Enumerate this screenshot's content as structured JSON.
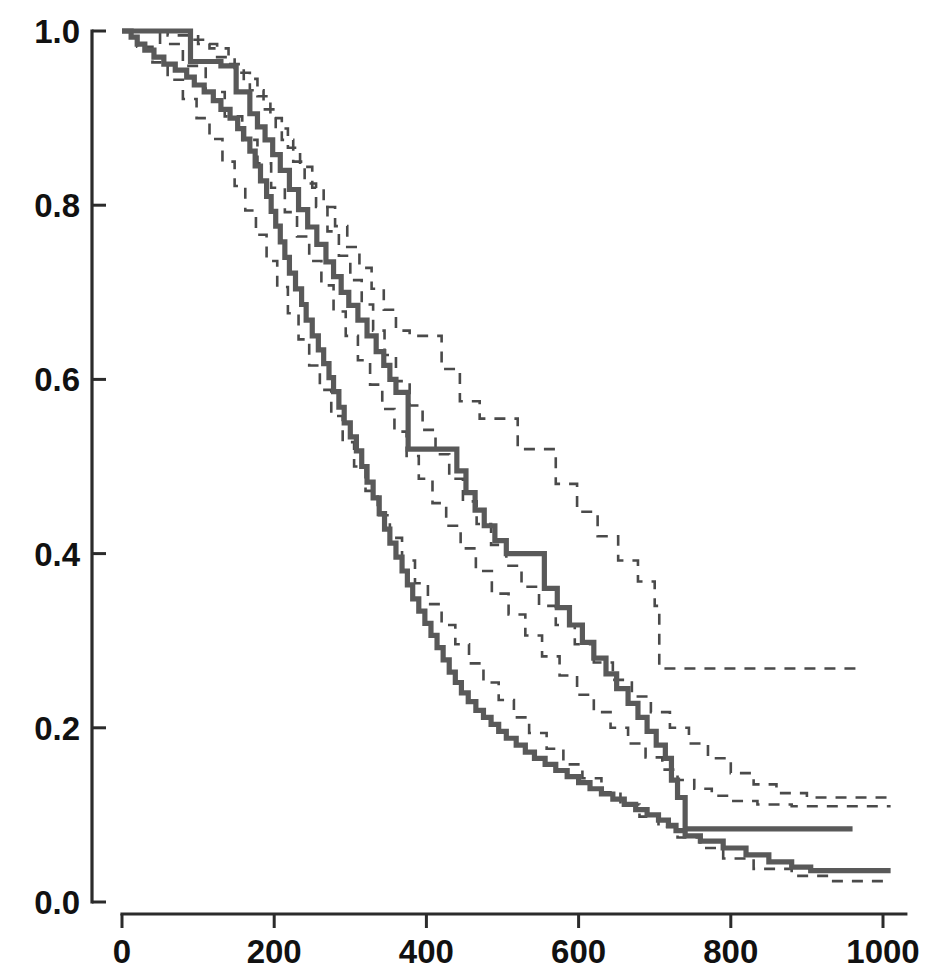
{
  "chart_data": {
    "type": "line",
    "subtype": "kaplan-meier-survival-step",
    "title": "",
    "subtitle": "",
    "xlabel": "",
    "ylabel": "",
    "xlim": [
      0,
      1030
    ],
    "ylim": [
      0.0,
      1.0
    ],
    "grid": false,
    "legend": "none",
    "x_ticks": [
      0,
      200,
      400,
      600,
      800,
      1000
    ],
    "x_tick_labels": [
      "0",
      "200",
      "400",
      "600",
      "800",
      "1000"
    ],
    "y_ticks": [
      0.0,
      0.2,
      0.4,
      0.6,
      0.8,
      1.0
    ],
    "y_tick_labels": [
      "0.0",
      "0.2",
      "0.4",
      "0.6",
      "0.8",
      "1.0"
    ],
    "colors": {
      "solid_curve": "#595959",
      "dashed_ci": "#4a4a4a",
      "axis": "#2b2b2b",
      "tick_text": "#111111",
      "background": "#ffffff"
    },
    "line_styles": {
      "estimate": "solid",
      "confidence_interval": "dashed"
    },
    "series": [
      {
        "name": "Group 1 estimate",
        "style": "solid",
        "x": [
          0,
          12,
          20,
          30,
          42,
          55,
          70,
          85,
          95,
          108,
          120,
          130,
          142,
          152,
          160,
          168,
          175,
          182,
          190,
          196,
          202,
          208,
          214,
          220,
          228,
          236,
          242,
          250,
          258,
          265,
          272,
          278,
          285,
          292,
          300,
          308,
          315,
          322,
          330,
          338,
          345,
          352,
          360,
          368,
          375,
          382,
          390,
          398,
          406,
          414,
          422,
          430,
          438,
          446,
          455,
          465,
          475,
          485,
          495,
          505,
          518,
          530,
          542,
          556,
          570,
          585,
          600,
          615,
          630,
          645,
          660,
          675,
          690,
          705,
          718,
          728,
          740,
          760,
          790,
          820,
          850,
          880,
          905,
          1010
        ],
        "y": [
          1.0,
          0.993,
          0.985,
          0.978,
          0.97,
          0.962,
          0.955,
          0.947,
          0.938,
          0.93,
          0.92,
          0.91,
          0.9,
          0.888,
          0.876,
          0.862,
          0.845,
          0.828,
          0.81,
          0.793,
          0.776,
          0.758,
          0.74,
          0.722,
          0.704,
          0.686,
          0.668,
          0.65,
          0.634,
          0.618,
          0.602,
          0.586,
          0.568,
          0.55,
          0.534,
          0.518,
          0.5,
          0.482,
          0.464,
          0.446,
          0.428,
          0.412,
          0.396,
          0.38,
          0.364,
          0.348,
          0.334,
          0.32,
          0.306,
          0.292,
          0.278,
          0.264,
          0.252,
          0.24,
          0.23,
          0.22,
          0.212,
          0.204,
          0.196,
          0.188,
          0.18,
          0.172,
          0.165,
          0.158,
          0.151,
          0.144,
          0.137,
          0.13,
          0.124,
          0.118,
          0.112,
          0.106,
          0.1,
          0.094,
          0.088,
          0.082,
          0.076,
          0.07,
          0.062,
          0.054,
          0.046,
          0.04,
          0.036,
          0.036
        ]
      },
      {
        "name": "Group 2 estimate",
        "style": "solid",
        "x": [
          0,
          60,
          90,
          130,
          150,
          168,
          178,
          188,
          198,
          208,
          220,
          232,
          244,
          256,
          268,
          278,
          288,
          298,
          310,
          322,
          334,
          344,
          352,
          360,
          376,
          431,
          440,
          452,
          464,
          476,
          490,
          505,
          520,
          555,
          572,
          588,
          605,
          620,
          636,
          650,
          665,
          678,
          690,
          702,
          714,
          722,
          730,
          740,
          960
        ],
        "y": [
          1.0,
          1.0,
          0.965,
          0.96,
          0.93,
          0.905,
          0.89,
          0.875,
          0.858,
          0.84,
          0.818,
          0.795,
          0.775,
          0.755,
          0.735,
          0.718,
          0.7,
          0.685,
          0.668,
          0.65,
          0.632,
          0.616,
          0.6,
          0.585,
          0.52,
          0.52,
          0.495,
          0.47,
          0.45,
          0.432,
          0.415,
          0.4,
          0.4,
          0.36,
          0.338,
          0.318,
          0.298,
          0.28,
          0.262,
          0.245,
          0.228,
          0.212,
          0.196,
          0.18,
          0.165,
          0.14,
          0.12,
          0.084,
          0.084
        ]
      },
      {
        "name": "Group 1 upper 95% CI",
        "style": "dashed",
        "x": [
          0,
          30,
          60,
          90,
          115,
          140,
          160,
          178,
          195,
          210,
          225,
          240,
          255,
          270,
          285,
          300,
          315,
          330,
          345,
          360,
          378,
          395,
          412,
          430,
          448,
          466,
          485,
          505,
          525,
          548,
          570,
          595,
          620,
          645,
          670,
          695,
          720,
          745,
          770,
          800,
          830,
          860,
          900,
          1010
        ],
        "y": [
          1.0,
          1.0,
          0.995,
          0.99,
          0.98,
          0.962,
          0.945,
          0.925,
          0.9,
          0.875,
          0.85,
          0.825,
          0.798,
          0.77,
          0.742,
          0.714,
          0.686,
          0.656,
          0.628,
          0.598,
          0.57,
          0.542,
          0.514,
          0.486,
          0.46,
          0.434,
          0.41,
          0.386,
          0.362,
          0.34,
          0.318,
          0.296,
          0.275,
          0.255,
          0.236,
          0.218,
          0.2,
          0.182,
          0.165,
          0.148,
          0.135,
          0.125,
          0.12,
          0.12
        ]
      },
      {
        "name": "Group 1 lower 95% CI",
        "style": "dashed",
        "x": [
          0,
          20,
          40,
          60,
          80,
          98,
          115,
          132,
          148,
          162,
          176,
          190,
          204,
          218,
          232,
          246,
          260,
          275,
          290,
          305,
          320,
          336,
          352,
          368,
          385,
          402,
          420,
          438,
          456,
          475,
          495,
          515,
          535,
          558,
          580,
          605,
          630,
          655,
          680,
          705,
          730,
          760,
          790,
          830,
          880,
          930,
          1010
        ],
        "y": [
          1.0,
          0.982,
          0.964,
          0.944,
          0.922,
          0.9,
          0.876,
          0.85,
          0.822,
          0.794,
          0.766,
          0.736,
          0.706,
          0.676,
          0.646,
          0.616,
          0.588,
          0.558,
          0.528,
          0.5,
          0.472,
          0.444,
          0.418,
          0.392,
          0.366,
          0.342,
          0.318,
          0.296,
          0.274,
          0.252,
          0.232,
          0.212,
          0.194,
          0.176,
          0.158,
          0.142,
          0.126,
          0.112,
          0.098,
          0.086,
          0.074,
          0.062,
          0.05,
          0.038,
          0.03,
          0.024,
          0.024
        ]
      },
      {
        "name": "Group 2 upper 95% CI",
        "style": "dashed",
        "x": [
          0,
          75,
          100,
          125,
          148,
          168,
          186,
          202,
          218,
          234,
          250,
          265,
          280,
          296,
          312,
          328,
          344,
          360,
          378,
          398,
          420,
          444,
          470,
          496,
          520,
          545,
          570,
          598,
          625,
          652,
          678,
          700,
          706,
          730,
          760,
          790,
          830,
          870,
          965
        ],
        "y": [
          1.0,
          1.0,
          0.985,
          0.97,
          0.952,
          0.932,
          0.91,
          0.888,
          0.866,
          0.844,
          0.82,
          0.798,
          0.776,
          0.752,
          0.728,
          0.704,
          0.68,
          0.656,
          0.65,
          0.65,
          0.612,
          0.575,
          0.555,
          0.555,
          0.52,
          0.52,
          0.48,
          0.448,
          0.42,
          0.392,
          0.368,
          0.34,
          0.268,
          0.268,
          0.268,
          0.268,
          0.268,
          0.268,
          0.268
        ]
      },
      {
        "name": "Group 2 lower 95% CI",
        "style": "dashed",
        "x": [
          0,
          50,
          80,
          110,
          135,
          158,
          178,
          196,
          214,
          230,
          246,
          262,
          278,
          294,
          310,
          326,
          342,
          358,
          374,
          390,
          408,
          426,
          445,
          465,
          486,
          508,
          530,
          552,
          575,
          598,
          620,
          642,
          665,
          688,
          710,
          730,
          752,
          775,
          800,
          835,
          880,
          930,
          1010
        ],
        "y": [
          1.0,
          0.985,
          0.96,
          0.93,
          0.902,
          0.875,
          0.848,
          0.82,
          0.792,
          0.764,
          0.736,
          0.708,
          0.678,
          0.65,
          0.622,
          0.594,
          0.566,
          0.54,
          0.512,
          0.486,
          0.458,
          0.432,
          0.406,
          0.38,
          0.354,
          0.33,
          0.306,
          0.282,
          0.26,
          0.238,
          0.218,
          0.2,
          0.182,
          0.166,
          0.152,
          0.14,
          0.13,
          0.122,
          0.116,
          0.112,
          0.11,
          0.11,
          0.11
        ]
      }
    ],
    "annotations": [
      {
        "text": "upper curve final plateau",
        "value": 0.084
      },
      {
        "text": "lower curve final plateau",
        "value": 0.036
      }
    ]
  },
  "axes": {
    "y_tick_labels": [
      "1.0",
      "0.8",
      "0.6",
      "0.4",
      "0.2",
      "0.0"
    ],
    "x_tick_labels": [
      "0",
      "200",
      "400",
      "600",
      "800",
      "1000"
    ]
  }
}
